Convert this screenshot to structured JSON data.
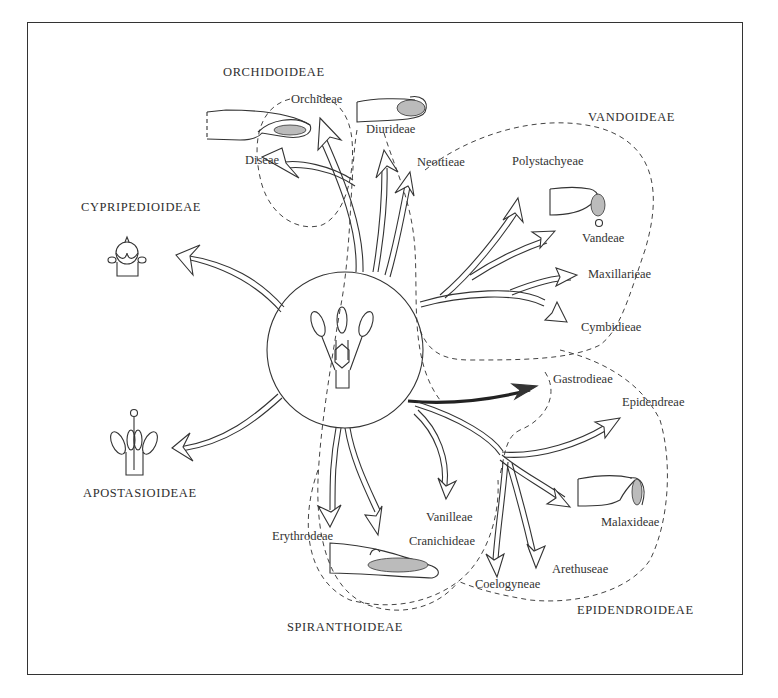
{
  "diagram": {
    "subfamilies": [
      {
        "id": "orchidoideae",
        "label": "ORCHIDOIDEAE",
        "x": 223,
        "y": 66
      },
      {
        "id": "vandoideae",
        "label": "VANDOIDEAE",
        "x": 588,
        "y": 111
      },
      {
        "id": "cypripedioideae",
        "label": "CYPRIPEDIOIDEAE",
        "x": 81,
        "y": 201
      },
      {
        "id": "apostasioideae",
        "label": "APOSTASIOIDEAE",
        "x": 83,
        "y": 487
      },
      {
        "id": "spiranthoideae",
        "label": "SPIRANTHOIDEAE",
        "x": 287,
        "y": 621
      },
      {
        "id": "epidendroideae",
        "label": "EPIDENDROIDEAE",
        "x": 577,
        "y": 604
      }
    ],
    "tribes": [
      {
        "id": "orchideae",
        "label": "Orchideae",
        "x": 291,
        "y": 93
      },
      {
        "id": "diurideae",
        "label": "Diurideae",
        "x": 366,
        "y": 123
      },
      {
        "id": "diseae",
        "label": "Diseae",
        "x": 245,
        "y": 154
      },
      {
        "id": "neottieae",
        "label": "Neottieae",
        "x": 417,
        "y": 156
      },
      {
        "id": "polystachyeae",
        "label": "Polystachyeae",
        "x": 512,
        "y": 155
      },
      {
        "id": "vandeae",
        "label": "Vandeae",
        "x": 582,
        "y": 232
      },
      {
        "id": "maxillarieae",
        "label": "Maxillarieae",
        "x": 588,
        "y": 268
      },
      {
        "id": "cymbidieae",
        "label": "Cymbidieae",
        "x": 581,
        "y": 321
      },
      {
        "id": "gastrodieae",
        "label": "Gastrodieae",
        "x": 553,
        "y": 373
      },
      {
        "id": "epidendreae",
        "label": "Epidendreae",
        "x": 622,
        "y": 396
      },
      {
        "id": "malaxideae",
        "label": "Malaxideae",
        "x": 601,
        "y": 516
      },
      {
        "id": "vanilleae",
        "label": "Vanilleae",
        "x": 426,
        "y": 511
      },
      {
        "id": "erythrodeae",
        "label": "Erythrodeae",
        "x": 272,
        "y": 530
      },
      {
        "id": "cranichideae",
        "label": "Cranichideae",
        "x": 409,
        "y": 535
      },
      {
        "id": "arethuseae",
        "label": "Arethuseae",
        "x": 552,
        "y": 563
      },
      {
        "id": "coelogyneae",
        "label": "Coelogyneae",
        "x": 475,
        "y": 578
      }
    ],
    "center": {
      "label": "ancestral-column",
      "cx": 345,
      "cy": 350,
      "r": 78
    },
    "colors": {
      "line": "#333333",
      "background": "#ffffff"
    }
  }
}
